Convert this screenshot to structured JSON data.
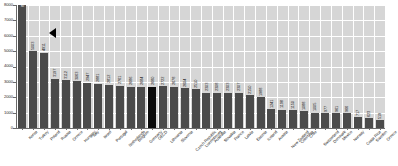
{
  "chart_data": {
    "type": "bar",
    "title": "",
    "xlabel": "",
    "ylabel": "",
    "ylim": [
      0,
      8000
    ],
    "ytick_step": 1000,
    "yticks": [
      "0",
      "1000",
      "2000",
      "3000",
      "4000",
      "5000",
      "6000",
      "7000",
      "8000"
    ],
    "grid": "both",
    "legend": "none",
    "highlight_category": "OECD",
    "highlight_color": "#0b0b0b",
    "bar_color": "#4b4b4b",
    "plot_background": "#d6d6d6",
    "gridline_color": "#ffffff",
    "categories": [
      "Korea",
      "Turkey",
      "Poland",
      "Russia",
      "Greece",
      "Hungary",
      "Italy",
      "Israel",
      "Portugal",
      "Netherlands",
      "Belgium",
      "Germany",
      "OECD",
      "Lithuania",
      "Slovenia",
      "Czech Republic",
      "Luxembourg",
      "Australia",
      "Slovakia",
      "France",
      "Latvia",
      "Estonia",
      "Iceland",
      "Austria",
      "New Zealand",
      "Colombia",
      "Chile",
      "Switzerland",
      "Denmark",
      "Mexico",
      "Norway",
      "Costa Rica",
      "Sweden",
      "Greece"
    ],
    "values": [
      8000,
      5003,
      4911,
      3197,
      3112,
      3063,
      2947,
      2881,
      2812,
      2761,
      2686,
      2684,
      2680,
      2722,
      2678,
      2604,
      2510,
      2303,
      2308,
      2303,
      2307,
      2150,
      1988,
      1241,
      1198,
      1150,
      1088,
      1005,
      977,
      961,
      966,
      717,
      623,
      519
    ],
    "value_labels": [
      "8000",
      "5003",
      "4911",
      "3197",
      "3112",
      "3063",
      "2947",
      "2881",
      "2812",
      "2761",
      "2686",
      "2684",
      "2680",
      "2722",
      "2678",
      "2604",
      "2510",
      "2303",
      "2308",
      "2303",
      "2307",
      "2150",
      "1988",
      "1241",
      "1198",
      "1150",
      "1088",
      "1005",
      "977",
      "961",
      "966",
      "717",
      "623",
      "519"
    ],
    "annotations": [
      {
        "name": "pointer-marker",
        "shape": "left-triangle",
        "near_category": "Poland"
      }
    ]
  }
}
